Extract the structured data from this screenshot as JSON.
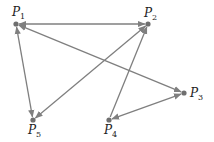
{
  "diagram": {
    "type": "directed-graph",
    "colors": {
      "edge": "#7f7f7f",
      "node": "#6f6f6f",
      "label": "#222222",
      "background": "#ffffff"
    },
    "nodes": [
      {
        "id": "P1",
        "label": "P",
        "sub": "1",
        "x": 16,
        "y": 24,
        "lx": 12,
        "ly": 16
      },
      {
        "id": "P2",
        "label": "P",
        "sub": "2",
        "x": 148,
        "y": 24,
        "lx": 144,
        "ly": 17
      },
      {
        "id": "P3",
        "label": "P",
        "sub": "3",
        "x": 184,
        "y": 93,
        "lx": 190,
        "ly": 97
      },
      {
        "id": "P4",
        "label": "P",
        "sub": "4",
        "x": 109,
        "y": 120,
        "lx": 104,
        "ly": 134
      },
      {
        "id": "P5",
        "label": "P",
        "sub": "5",
        "x": 33,
        "y": 120,
        "lx": 28,
        "ly": 134
      }
    ],
    "edges": [
      {
        "from": "P1",
        "to": "P2",
        "arrow_start": true,
        "arrow_end": true
      },
      {
        "from": "P1",
        "to": "P3",
        "arrow_start": true,
        "arrow_end": true
      },
      {
        "from": "P1",
        "to": "P5",
        "arrow_start": true,
        "arrow_end": true
      },
      {
        "from": "P2",
        "to": "P5",
        "arrow_start": true,
        "arrow_end": true
      },
      {
        "from": "P4",
        "to": "P2",
        "arrow_start": false,
        "arrow_end": true
      },
      {
        "from": "P3",
        "to": "P4",
        "arrow_start": true,
        "arrow_end": true
      }
    ]
  }
}
